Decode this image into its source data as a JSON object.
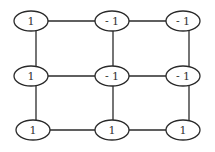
{
  "diagram": {
    "type": "grid-graph",
    "rows": 3,
    "cols": 3,
    "colors": {
      "stroke": "#2a2a2a",
      "node_fill": "#ffffff",
      "text": "#333333"
    },
    "nodes": [
      {
        "id": "n00",
        "row": 0,
        "col": 0,
        "label": "1"
      },
      {
        "id": "n01",
        "row": 0,
        "col": 1,
        "label": "- 1"
      },
      {
        "id": "n02",
        "row": 0,
        "col": 2,
        "label": "- 1"
      },
      {
        "id": "n10",
        "row": 1,
        "col": 0,
        "label": "1"
      },
      {
        "id": "n11",
        "row": 1,
        "col": 1,
        "label": "- 1"
      },
      {
        "id": "n12",
        "row": 1,
        "col": 2,
        "label": "- 1"
      },
      {
        "id": "n20",
        "row": 2,
        "col": 0,
        "label": "1"
      },
      {
        "id": "n21",
        "row": 2,
        "col": 1,
        "label": "1"
      },
      {
        "id": "n22",
        "row": 2,
        "col": 2,
        "label": "1"
      }
    ],
    "edges": [
      [
        "n00",
        "n01"
      ],
      [
        "n01",
        "n02"
      ],
      [
        "n10",
        "n11"
      ],
      [
        "n11",
        "n12"
      ],
      [
        "n20",
        "n21"
      ],
      [
        "n21",
        "n22"
      ],
      [
        "n00",
        "n10"
      ],
      [
        "n10",
        "n20"
      ],
      [
        "n01",
        "n11"
      ],
      [
        "n11",
        "n21"
      ],
      [
        "n02",
        "n12"
      ],
      [
        "n12",
        "n22"
      ]
    ]
  }
}
